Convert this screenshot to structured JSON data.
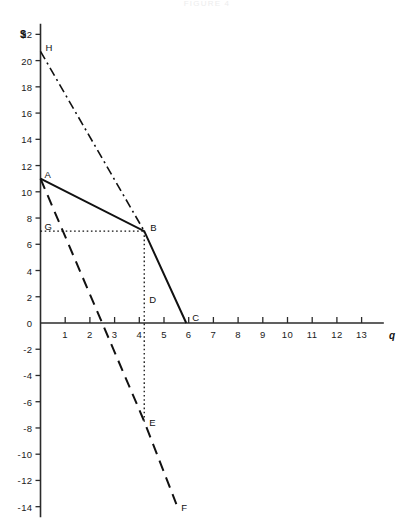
{
  "figure": {
    "caption": "FIGURE 4",
    "y_axis_title": "$",
    "x_axis_title": "q"
  },
  "chart_data": {
    "type": "line",
    "title": "",
    "subtitle": "",
    "xlabel": "q",
    "ylabel": "$",
    "xlim": [
      0,
      13.9
    ],
    "ylim": [
      -14.8,
      22.8
    ],
    "grid": false,
    "legend": "none",
    "x_ticks": [
      1,
      2,
      3,
      4,
      5,
      6,
      7,
      8,
      9,
      10,
      11,
      12,
      13
    ],
    "x_tick_labels": [
      "1",
      "2",
      "3",
      "4",
      "5",
      "6",
      "7",
      "8",
      "9",
      "10",
      "11",
      "12",
      "13"
    ],
    "y_ticks": [
      22,
      20,
      18,
      16,
      14,
      12,
      10,
      8,
      6,
      4,
      2,
      0,
      -2,
      -4,
      -6,
      -8,
      -10,
      -12,
      -14
    ],
    "y_tick_labels": [
      "22",
      "20",
      "18",
      "16",
      "14",
      "12",
      "10",
      "8",
      "6",
      "4",
      "2",
      "0",
      "-2",
      "-4",
      "-6",
      "-8",
      "-10",
      "-12",
      "-14"
    ],
    "points": [
      {
        "label": "H",
        "x": 0.0,
        "y": 20.7,
        "label_dx": 5,
        "label_dy": -9
      },
      {
        "label": "A",
        "x": 0.0,
        "y": 11.0,
        "label_dx": 4,
        "label_dy": -10
      },
      {
        "label": "G",
        "x": 0.0,
        "y": 7.0,
        "label_dx": 4,
        "label_dy": -10
      },
      {
        "label": "B",
        "x": 4.2,
        "y": 7.0,
        "label_dx": 6,
        "label_dy": -9
      },
      {
        "label": "D",
        "x": 4.2,
        "y": 2.0,
        "label_dx": 5,
        "label_dy": -3
      },
      {
        "label": "C",
        "x": 5.9,
        "y": 0.0,
        "label_dx": 6,
        "label_dy": -11
      },
      {
        "label": "E",
        "x": 4.2,
        "y": -7.5,
        "label_dx": 5,
        "label_dy": -4
      },
      {
        "label": "F",
        "x": 5.5,
        "y": -13.8,
        "label_dx": 5,
        "label_dy": -2
      }
    ],
    "series": [
      {
        "name": "solid-ABC",
        "style": "solid",
        "x": [
          0.0,
          4.2,
          5.9
        ],
        "y": [
          11.0,
          7.0,
          0.0
        ]
      },
      {
        "name": "dashdot-HB",
        "style": "dashdot",
        "x": [
          0.0,
          4.2
        ],
        "y": [
          20.7,
          7.0
        ]
      },
      {
        "name": "dashed-ADEF",
        "style": "dashed",
        "x": [
          0.0,
          4.2,
          5.5
        ],
        "y": [
          11.0,
          -7.5,
          -13.8
        ]
      },
      {
        "name": "dotted-GB",
        "style": "dotted",
        "x": [
          0.0,
          4.2
        ],
        "y": [
          7.0,
          7.0
        ]
      },
      {
        "name": "dotted-BE",
        "style": "dotted",
        "x": [
          4.2,
          4.2
        ],
        "y": [
          7.0,
          -7.7
        ]
      }
    ]
  }
}
